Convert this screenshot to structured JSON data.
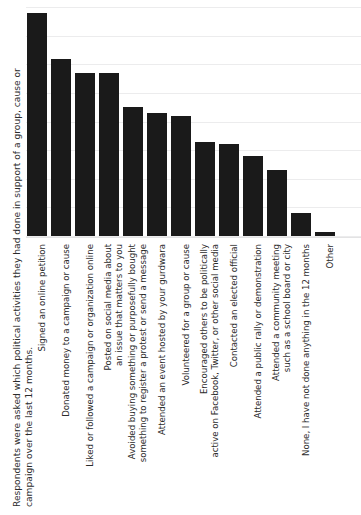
{
  "caption": {
    "line1": "Respondents were asked which political activities they had done in support of a group, cause or",
    "line2": "campaign over the last 12 months."
  },
  "chart_data": {
    "type": "bar",
    "title": "",
    "subtitle": "",
    "xlabel": "",
    "ylabel": "",
    "ylim": [
      0,
      40
    ],
    "grid": true,
    "gridline_count": 9,
    "legend": "none",
    "bar_color": "#1a1a1a",
    "gridline_color": "#ececed",
    "background_color": "#ffffff",
    "orientation": "vertical",
    "tick_labels_visible": false,
    "categories": [
      "Signed an online petition",
      "Donated money to a campaign or cause",
      "Liked or followed a campaign or organization online",
      "Posted on social media about an issue that matters to you",
      "Avoided buying something or purposefully bought something to register a protest or send a message",
      "Attended an event hosted by your gurdwara",
      "Volunteered for a group or cause",
      "Encouraged others to be politically active on Facebook, Twitter, or other social media",
      "Contacted an elected official",
      "Attended a public rally or demonstration",
      "Attended a community meeting such as a school board or city",
      "None, I have not done anything in the 12 months",
      "Other"
    ],
    "category_lines": [
      [
        "Signed an online petition"
      ],
      [
        "Donated money to a campaign or cause"
      ],
      [
        "Liked or followed a campaign or organization online"
      ],
      [
        "Posted on social media about",
        "an issue that matters to you"
      ],
      [
        "Avoided buying something or purposefully bought",
        "something to register a protest or send a message"
      ],
      [
        "Attended an event hosted by your gurdwara"
      ],
      [
        "Volunteered for a group or cause"
      ],
      [
        "Encouraged others to be politically",
        "active on Facebook, Twitter, or other social media"
      ],
      [
        "Contacted an elected official"
      ],
      [
        "Attended a public rally or demonstration"
      ],
      [
        "Attended a community meeting",
        "such as a school board or city"
      ],
      [
        "None, I have not done anything in the 12 months"
      ],
      [
        "Other"
      ]
    ],
    "values": [
      39,
      31,
      28.5,
      28.5,
      22.5,
      21.5,
      21,
      16.5,
      16,
      14,
      11.5,
      4,
      0.7
    ]
  }
}
